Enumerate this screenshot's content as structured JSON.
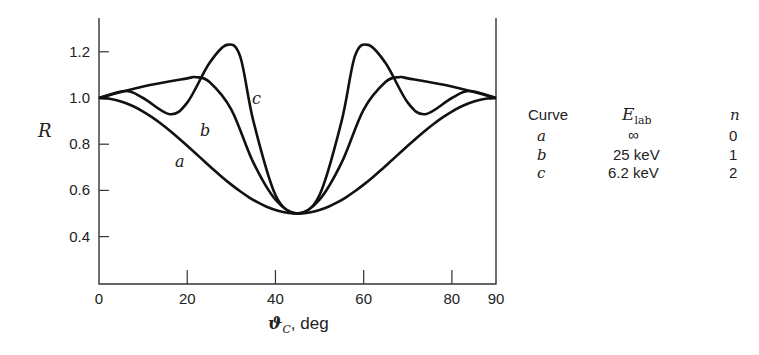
{
  "chart_data": {
    "type": "line",
    "title": "",
    "xlabel": "ϑ_C, deg",
    "ylabel": "R",
    "xlim": [
      0,
      90
    ],
    "ylim": [
      0.3,
      1.35
    ],
    "x_ticks": [
      "0",
      "20",
      "40",
      "60",
      "80",
      "90"
    ],
    "y_ticks": [
      "0.4",
      "0.6",
      "0.8",
      "1.0",
      "1.2"
    ],
    "grid": false,
    "legend_position": "right",
    "series": [
      {
        "name": "a",
        "x": [
          0,
          10,
          20,
          30,
          40,
          45,
          50,
          60,
          70,
          80,
          90
        ],
        "values": [
          1.0,
          0.94,
          0.79,
          0.63,
          0.52,
          0.5,
          0.52,
          0.63,
          0.79,
          0.94,
          1.0
        ]
      },
      {
        "name": "b",
        "x": [
          0,
          10,
          20,
          22,
          25,
          30,
          35,
          40,
          45,
          50,
          55,
          60,
          65,
          68,
          70,
          80,
          90
        ],
        "values": [
          1.0,
          1.05,
          1.085,
          1.09,
          1.07,
          0.95,
          0.72,
          0.56,
          0.5,
          0.56,
          0.72,
          0.95,
          1.07,
          1.09,
          1.085,
          1.05,
          1.0
        ]
      },
      {
        "name": "c",
        "x": [
          0,
          6,
          10,
          16,
          20,
          25,
          29,
          32,
          35,
          40,
          45,
          50,
          55,
          58,
          61,
          65,
          70,
          74,
          80,
          84,
          90
        ],
        "values": [
          1.0,
          1.03,
          1.0,
          0.93,
          0.98,
          1.15,
          1.23,
          1.18,
          0.9,
          0.58,
          0.5,
          0.58,
          0.9,
          1.18,
          1.23,
          1.15,
          0.98,
          0.93,
          1.0,
          1.03,
          1.0
        ]
      }
    ],
    "curve_labels": [
      "a",
      "b",
      "c"
    ]
  },
  "axis": {
    "ylabel": "R",
    "xlabel_sym": "ϑ",
    "xlabel_sub": "C",
    "xlabel_unit": ", deg"
  },
  "legend": {
    "headers": {
      "curve": "Curve",
      "energy": "E",
      "energy_sub": "lab",
      "n": "n"
    },
    "rows": [
      {
        "curve": "a",
        "energy": "∞",
        "n": "0"
      },
      {
        "curve": "b",
        "energy": "25 keV",
        "n": "1"
      },
      {
        "curve": "c",
        "energy": "6.2 keV",
        "n": "2"
      }
    ]
  }
}
